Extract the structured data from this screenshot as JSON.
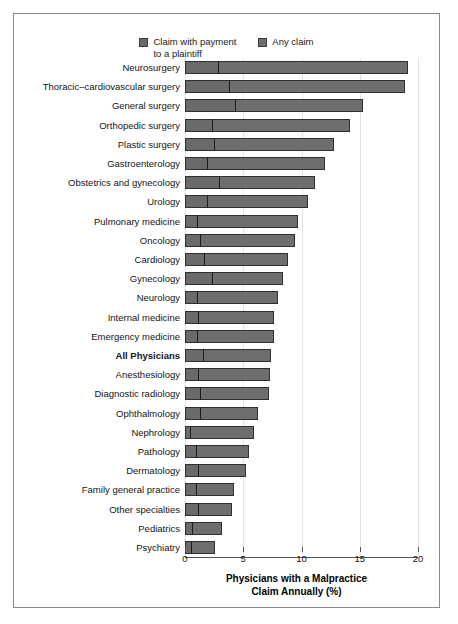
{
  "legend": {
    "entries": [
      {
        "label": "Claim with payment\nto a plaintiff",
        "color": "#6a6a6a"
      },
      {
        "label": "Any claim",
        "color": "#6e6e6e"
      }
    ]
  },
  "axis": {
    "x_title": "Physicians with a Malpractice\nClaim Annually (%)",
    "x_ticks": [
      "0",
      "5",
      "10",
      "15",
      "20"
    ],
    "x_min": 0,
    "x_max": 20
  },
  "chart_data": {
    "type": "bar",
    "orientation": "horizontal",
    "title": "",
    "subtitle": "",
    "xlabel": "Physicians with a Malpractice Claim Annually (%)",
    "ylabel": "",
    "xlim": [
      0,
      20
    ],
    "xticks": [
      0,
      5,
      10,
      15,
      20
    ],
    "grid": true,
    "legend_position": "top-center",
    "categories": [
      "Neurosurgery",
      "Thoracic–cardiovascular surgery",
      "General surgery",
      "Orthopedic surgery",
      "Plastic surgery",
      "Gastroenterology",
      "Obstetrics and gynecology",
      "Urology",
      "Pulmonary medicine",
      "Oncology",
      "Cardiology",
      "Gynecology",
      "Neurology",
      "Internal medicine",
      "Emergency medicine",
      "All Physicians",
      "Anesthesiology",
      "Diagnostic radiology",
      "Ophthalmology",
      "Nephrology",
      "Pathology",
      "Dermatology",
      "Family general practice",
      "Other specialties",
      "Pediatrics",
      "Psychiatry"
    ],
    "highlighted_category": "All Physicians",
    "series": [
      {
        "name": "Any claim",
        "values": [
          19.1,
          18.9,
          15.3,
          14.2,
          12.8,
          12.0,
          11.2,
          10.6,
          9.7,
          9.4,
          8.8,
          8.4,
          8.0,
          7.6,
          7.6,
          7.4,
          7.3,
          7.2,
          6.3,
          5.9,
          5.5,
          5.2,
          4.2,
          4.0,
          3.2,
          2.6
        ]
      },
      {
        "name": "Claim with payment to a plaintiff",
        "values": [
          2.9,
          3.9,
          4.4,
          2.4,
          2.6,
          2.0,
          3.0,
          2.0,
          1.1,
          1.4,
          1.7,
          2.4,
          1.1,
          1.2,
          1.1,
          1.6,
          1.2,
          1.4,
          1.4,
          0.5,
          1.0,
          1.2,
          1.0,
          1.2,
          0.7,
          0.6
        ]
      }
    ]
  }
}
